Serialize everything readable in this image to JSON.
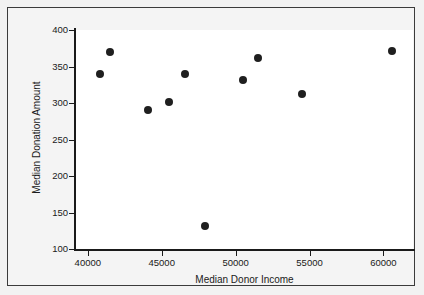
{
  "chart_data": {
    "type": "scatter",
    "title": "",
    "xlabel": "Median Donor Income",
    "ylabel": "Median Donation Amount",
    "xlim": [
      39200,
      62000
    ],
    "ylim": [
      100,
      400
    ],
    "grid": false,
    "legend": null,
    "xticks": [
      "40000",
      "45000",
      "50000",
      "55000",
      "60000"
    ],
    "xtick_values": [
      40000,
      45000,
      50000,
      55000,
      60000
    ],
    "yticks": [
      "400",
      "350",
      "300",
      "250",
      "200",
      "150",
      "100"
    ],
    "ytick_values": [
      400,
      350,
      300,
      250,
      200,
      150,
      100
    ],
    "marker": "filled-circle",
    "marker_color": "#1f1f1f",
    "points": [
      {
        "x": 40800,
        "y": 340
      },
      {
        "x": 41500,
        "y": 370
      },
      {
        "x": 44100,
        "y": 290
      },
      {
        "x": 45500,
        "y": 301
      },
      {
        "x": 46600,
        "y": 340
      },
      {
        "x": 47900,
        "y": 131
      },
      {
        "x": 50500,
        "y": 331
      },
      {
        "x": 51500,
        "y": 361
      },
      {
        "x": 54500,
        "y": 312
      },
      {
        "x": 60600,
        "y": 371
      }
    ]
  },
  "figure": {
    "border_color": "#3b3b3b",
    "background_color": "#f2f2f2",
    "plot_background_color": "#ffffff",
    "axis_color": "#1a1a1a"
  }
}
